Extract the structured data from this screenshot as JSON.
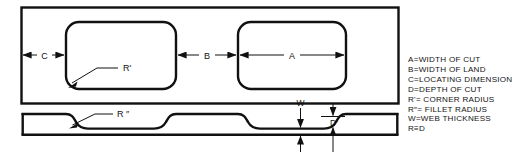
{
  "figure": {
    "line_color": "#111111",
    "background": "#ffffff"
  },
  "top_view": {
    "name": "plan-view",
    "dimensions": [
      {
        "label": "C",
        "name": "dimension-c"
      },
      {
        "label": "B",
        "name": "dimension-b"
      },
      {
        "label": "A",
        "name": "dimension-a"
      }
    ],
    "callouts": [
      {
        "label": "R'",
        "name": "callout-r-prime"
      }
    ]
  },
  "section_view": {
    "name": "section-view",
    "dimensions": [
      {
        "label": "W",
        "name": "dimension-w"
      },
      {
        "label": "D",
        "name": "dimension-d"
      }
    ],
    "callouts": [
      {
        "label": "R ″",
        "name": "callout-r-double-prime"
      }
    ]
  },
  "legend": {
    "name": "legend-block",
    "lines": [
      "A=WIDTH OF CUT",
      "B=WIDTH OF LAND",
      "C=LOCATING DIMENSION",
      "D=DEPTH OF CUT",
      "R'= CORNER RADIUS",
      "R″= FILLET RADIUS",
      "W=WEB THICKNESS",
      "R≡D"
    ]
  }
}
